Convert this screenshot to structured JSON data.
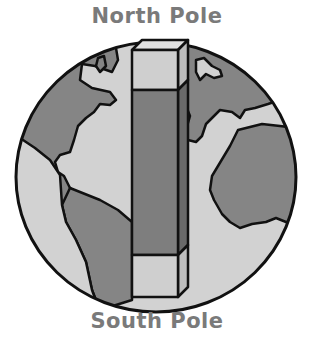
{
  "labels": {
    "top": "North Pole",
    "bottom": "South Pole"
  },
  "colors": {
    "label_text": "#7a7a7a",
    "ocean": "#d2d2d2",
    "land": "#858585",
    "outline": "#111111",
    "column_cap": "#cfcfcf",
    "column_cap_side": "#bdbdbd",
    "column_middle": "#7e7e7e",
    "column_middle_side": "#6a6a6a"
  },
  "diagram": {
    "globe": {
      "cx": 156,
      "cy": 177,
      "rx": 140,
      "ry": 135
    },
    "column": {
      "x": 132,
      "width": 46,
      "depth": 10,
      "top_cap": {
        "y": 50,
        "height": 40
      },
      "middle": {
        "y": 90,
        "height": 165
      },
      "bottom_cap": {
        "y": 255,
        "height": 42
      }
    }
  }
}
